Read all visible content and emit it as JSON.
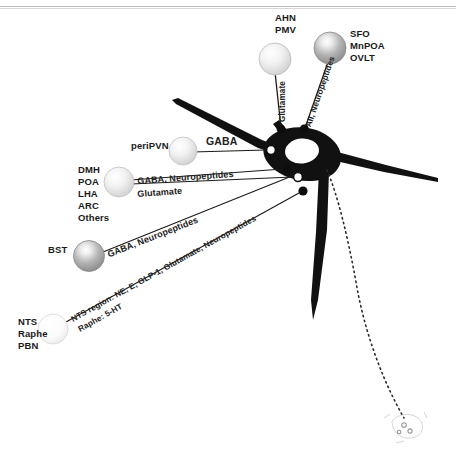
{
  "figure": {
    "type": "neuroanatomical-circuit-schematic",
    "background_color": "#ffffff",
    "ink_color": "#000000"
  },
  "inputs": [
    {
      "id": "ahn-pmv",
      "region_label": "AHN\nPMV",
      "region_lines": [
        "AHN",
        "PMV"
      ],
      "transmitter": "Glutamate",
      "terminal_type": "filled",
      "sphere_shade": "light"
    },
    {
      "id": "sfo-mnpoa-ovlt",
      "region_label": "SFO\nMnPOA\nOVLT",
      "region_lines": [
        "SFO",
        "MnPOA",
        "OVLT"
      ],
      "transmitter": "AII, Neuropeptides",
      "terminal_type": "filled",
      "sphere_shade": "dark"
    },
    {
      "id": "peripvn",
      "region_label": "periPVN",
      "region_lines": [
        "periPVN"
      ],
      "transmitter": "GABA",
      "terminal_type": "open",
      "sphere_shade": "light"
    },
    {
      "id": "dmh-poa-lha-arc-others",
      "region_label": "DMH\nPOA\nLHA\nARC\nOthers",
      "region_lines": [
        "DMH",
        "POA",
        "LHA",
        "ARC",
        "Others"
      ],
      "transmitter": "GABA, Neuropeptides",
      "transmitter_2": "Glutamate",
      "terminal_type": "mixed",
      "sphere_shade": "light"
    },
    {
      "id": "bst",
      "region_label": "BST",
      "region_lines": [
        "BST"
      ],
      "transmitter": "GABA, Neuropeptides",
      "terminal_type": "open",
      "sphere_shade": "dark"
    },
    {
      "id": "nts-raphe-pbn",
      "region_label": "NTS\nRaphe\nPBN",
      "region_lines": [
        "NTS",
        "Raphe",
        "PBN"
      ],
      "transmitter": "NTS region: NE, E, GLP-1, Glutamate, Neuropeptides",
      "transmitter_2": "Raphe: 5-HT",
      "terminal_type": "filled",
      "sphere_shade": "very-light"
    }
  ],
  "labels": {
    "ahn": "AHN",
    "pmv": "PMV",
    "sfo": "SFO",
    "mnpoa": "MnPOA",
    "ovlt": "OVLT",
    "peripvn": "periPVN",
    "dmh": "DMH",
    "poa": "POA",
    "lha": "LHA",
    "arc": "ARC",
    "others": "Others",
    "bst": "BST",
    "nts": "NTS",
    "raphe": "Raphe",
    "pbn": "PBN"
  },
  "transmitters": {
    "glutamate_vertical": "Glutamate",
    "aii_neuropeptides": "AII, Neuropeptides",
    "gaba": "GABA",
    "gaba_neuropeptides": "GABA, Neuropeptides",
    "glutamate": "Glutamate",
    "gaba_neuropeptides_bst": "GABA, Neuropeptides",
    "nts_region": "NTS region: NE, E, GLP-1, Glutamate, Neuropeptides",
    "raphe_5ht": "Raphe: 5-HT"
  },
  "neuron": {
    "name": "PVN neuron",
    "soma_color": "#000000",
    "nucleus_color": "#ffffff",
    "axon_style": "dotted",
    "dendrite_count": 4
  }
}
